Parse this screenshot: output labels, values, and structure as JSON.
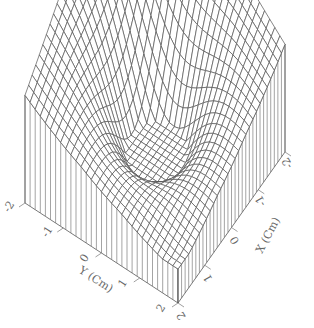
{
  "chart_data": {
    "type": "surface",
    "title": "",
    "xlabel": "X (Cm)",
    "ylabel": "Y (Cm)",
    "zlabel": "",
    "xlim": [
      -2,
      2
    ],
    "ylim": [
      -2,
      2
    ],
    "x_ticks": [
      "-2",
      "-1",
      "0",
      "1",
      "2"
    ],
    "y_ticks": [
      "-2",
      "-1",
      "0",
      "1",
      "2"
    ],
    "grid_n": 30,
    "surface_description": "Raised plateau near the edges with a deep circular dip at the center (approximately z = 1 - exp(-(x^2+y^2)) style), drawn as a wireframe mesh over a box with hatched side walls",
    "line_color": "#555555",
    "background": "#ffffff"
  }
}
